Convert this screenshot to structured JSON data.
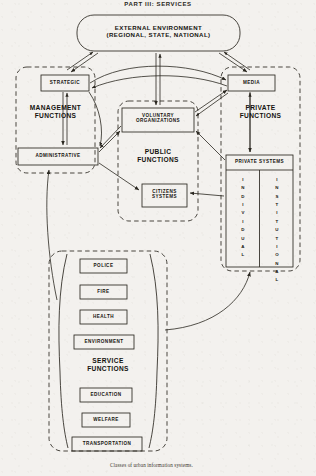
{
  "headline": "PART III: SERVICES",
  "caption": "Classes of urban information systems.",
  "environment": {
    "line1": "EXTERNAL ENVIRONMENT",
    "line2": "(REGIONAL, STATE, NATIONAL)"
  },
  "regions": {
    "management": "MANAGEMENT\nFUNCTIONS",
    "public": "PUBLIC\nFUNCTIONS",
    "private": "PRIVATE\nFUNCTIONS",
    "service": "SERVICE\nFUNCTIONS"
  },
  "boxes": {
    "strategic": "STRATEGIC",
    "administrative": "ADMINISTRATIVE",
    "media": "MEDIA",
    "voluntary": "VOLUNTARY\nORGANIZATIONS",
    "citizens": "CITIZENS\nSYSTEMS",
    "private_systems": "PRIVATE SYSTEMS"
  },
  "private_systems_columns": [
    {
      "name": "individual",
      "label": "INDIVIDUAL"
    },
    {
      "name": "institutional",
      "label": "INSTITUTIONAL"
    }
  ],
  "service_boxes": [
    {
      "name": "police",
      "label": "POLICE"
    },
    {
      "name": "fire",
      "label": "FIRE"
    },
    {
      "name": "health",
      "label": "HEALTH"
    },
    {
      "name": "environment",
      "label": "ENVIRONMENT"
    },
    {
      "name": "education",
      "label": "EDUCATION"
    },
    {
      "name": "welfare",
      "label": "WELFARE"
    },
    {
      "name": "transportation",
      "label": "TRANSPORTATION"
    }
  ],
  "colors": {
    "ink": "#15130f",
    "paper": "#f3f1ee",
    "line": "#2a2720"
  }
}
